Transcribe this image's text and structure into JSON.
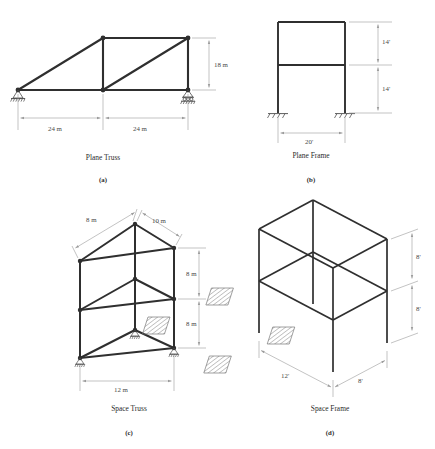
{
  "figure": {
    "panels": [
      {
        "id": "plane-truss",
        "caption": "Plane Truss",
        "sublabel": "(a)",
        "dimensions": [
          {
            "name": "span-left",
            "text": "24 m"
          },
          {
            "name": "span-right",
            "text": "24 m"
          },
          {
            "name": "height",
            "text": "18 m"
          }
        ],
        "supports": [
          "pin",
          "roller"
        ]
      },
      {
        "id": "plane-frame",
        "caption": "Plane Frame",
        "sublabel": "(b)",
        "dimensions": [
          {
            "name": "upper-story-height",
            "text": "14'"
          },
          {
            "name": "lower-story-height",
            "text": "14'"
          },
          {
            "name": "bay-width",
            "text": "20'"
          }
        ],
        "supports": [
          "fixed",
          "fixed"
        ]
      },
      {
        "id": "space-truss",
        "caption": "Space Truss",
        "sublabel": "(c)",
        "dimensions": [
          {
            "name": "top-left-member",
            "text": "8 m"
          },
          {
            "name": "top-right-member",
            "text": "10 m"
          },
          {
            "name": "upper-level-height",
            "text": "8 m"
          },
          {
            "name": "lower-level-height",
            "text": "8 m"
          },
          {
            "name": "base-width",
            "text": "12 m"
          }
        ],
        "supports": [
          "roller",
          "roller",
          "roller"
        ]
      },
      {
        "id": "space-frame",
        "caption": "Space Frame",
        "sublabel": "(d)",
        "dimensions": [
          {
            "name": "upper-story-height",
            "text": "8'"
          },
          {
            "name": "lower-story-height",
            "text": "8'"
          },
          {
            "name": "bay-length",
            "text": "12'"
          },
          {
            "name": "bay-width",
            "text": "8'"
          }
        ],
        "supports": [
          "fixed",
          "fixed",
          "fixed",
          "fixed"
        ]
      }
    ]
  },
  "colors": {
    "member": "#2f2f2f",
    "dimension_line": "#9a9a9a",
    "text": "#2b2b2b",
    "hatch": "#6e6e6e"
  }
}
